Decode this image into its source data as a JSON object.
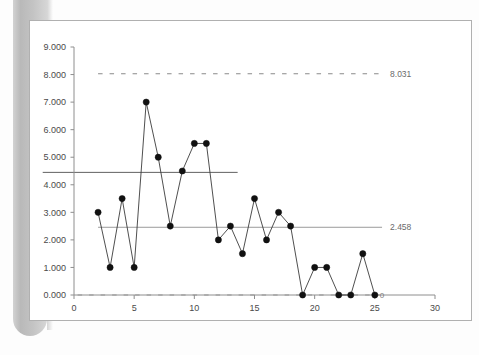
{
  "chart_data": {
    "type": "line",
    "title": "",
    "xlabel": "",
    "ylabel": "",
    "xlim": [
      0,
      30
    ],
    "ylim": [
      0,
      9
    ],
    "grid": false,
    "legend": "none",
    "marker": "filled-circle",
    "x": [
      2,
      3,
      4,
      5,
      6,
      7,
      8,
      9,
      10,
      11,
      12,
      13,
      14,
      15,
      16,
      17,
      18,
      19,
      20,
      21,
      22,
      23,
      24,
      25
    ],
    "values": [
      3.0,
      1.0,
      3.5,
      1.0,
      7.0,
      5.0,
      2.5,
      4.5,
      5.5,
      5.5,
      2.0,
      2.5,
      1.5,
      3.5,
      2.0,
      3.0,
      2.5,
      0.0,
      1.0,
      1.0,
      0.0,
      0.0,
      1.5,
      0.0
    ],
    "series": [
      {
        "name": "measurements",
        "values": [
          3.0,
          1.0,
          3.5,
          1.0,
          7.0,
          5.0,
          2.5,
          4.5,
          5.5,
          5.5,
          2.0,
          2.5,
          1.5,
          3.5,
          2.0,
          3.0,
          2.5,
          0.0,
          1.0,
          1.0,
          0.0,
          0.0,
          1.5,
          0.0
        ]
      }
    ],
    "y_tick_labels": [
      "0.000",
      "1.000",
      "2.000",
      "3.000",
      "4.000",
      "5.000",
      "6.000",
      "7.000",
      "8.000",
      "9.000"
    ],
    "y_tick_values": [
      0,
      1,
      2,
      3,
      4,
      5,
      6,
      7,
      8,
      9
    ],
    "x_tick_labels": [
      "0",
      "5",
      "10",
      "15",
      "20",
      "25",
      "30"
    ],
    "x_tick_values": [
      0,
      5,
      10,
      15,
      20,
      25,
      30
    ],
    "reference_lines": [
      {
        "name": "upper-dashed-limit",
        "label": "8.031",
        "value": 8.031,
        "style": "dashed",
        "color": "#8a8a8a",
        "x_start": 2.0,
        "x_end": 25.6
      },
      {
        "name": "mid-solid-limit",
        "label": "",
        "value": 4.45,
        "style": "solid",
        "color": "#4f4f4f",
        "x_start": -2.6,
        "x_end": 13.6
      },
      {
        "name": "lower-solid-mean",
        "label": "2.458",
        "value": 2.458,
        "style": "solid",
        "color": "#8f8f8f",
        "x_start": 2.0,
        "x_end": 25.6
      },
      {
        "name": "baseline-dashed-zero",
        "label": "",
        "value": 0.0,
        "style": "dashed",
        "color": "#9a9a9a",
        "x_start": 0.3,
        "x_end": 25.4
      }
    ],
    "annotations": [
      {
        "name": "last-point-value-label",
        "text": "0",
        "x": 25,
        "y": 0
      }
    ]
  },
  "labels": {
    "upper_limit": "8.031",
    "mean_line": "2.458",
    "last_point": "0"
  },
  "colors": {
    "line": "#3b3b3b",
    "marker": "#111111",
    "axis": "#8e8e8e",
    "tick_text": "#4a4a4a",
    "frame": "#b0b0b0",
    "annotation_text": "#6a6a6a",
    "scan_artifact": "#c0c0c0"
  }
}
